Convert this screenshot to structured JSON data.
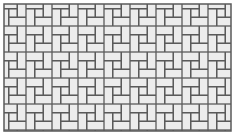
{
  "figure": {
    "type": "brick-tiling-pattern",
    "pattern_name": "pinwheel-basketweave",
    "colors": {
      "background": "#ffffff",
      "tile_fill": "#ececec",
      "grout": "#5a5a5a"
    },
    "frame": {
      "x": 4,
      "y": 4,
      "width": 227,
      "height": 127
    },
    "tile": {
      "period": 26,
      "unit": 8.67,
      "brick_long": 17.33,
      "brick_short": 8.67
    }
  }
}
